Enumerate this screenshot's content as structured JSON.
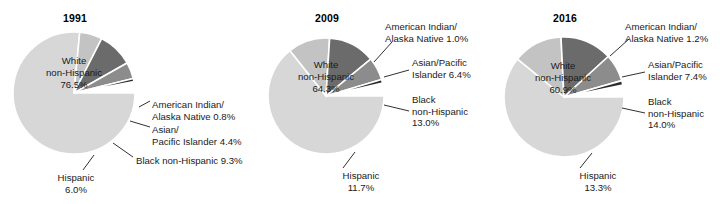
{
  "figure": {
    "background": "#ffffff",
    "panel_count": 3
  },
  "chart_data": [
    {
      "type": "pie",
      "title": "1991",
      "categories": [
        "White non-Hispanic",
        "American Indian/Alaska Native",
        "Asian/Pacific Islander",
        "Black non-Hispanic",
        "Hispanic"
      ],
      "values": [
        76.5,
        0.8,
        4.4,
        9.3,
        6.0
      ],
      "value_labels": [
        "76.5%",
        "0.8%",
        "4.4%",
        "9.3%",
        "6.0%"
      ],
      "colors": [
        "#d7d7d7",
        "#2b2b2b",
        "#8c8c8c",
        "#6b6b6b",
        "#c3c3c3"
      ],
      "legend": "none",
      "annotations": [
        {
          "name": "white-non-hispanic",
          "text_lines": [
            "White",
            "non-Hispanic",
            "76.5%"
          ],
          "placement": "inside"
        },
        {
          "name": "american-indian-alaska-native",
          "text_lines": [
            "American Indian/",
            "Alaska Native 0.8%"
          ],
          "placement": "right"
        },
        {
          "name": "asian-pacific-islander",
          "text_lines": [
            "Asian/",
            "Pacific Islander 4.4%"
          ],
          "placement": "right"
        },
        {
          "name": "black-non-hispanic",
          "text_lines": [
            "Black non-Hispanic 9.3%"
          ],
          "placement": "right"
        },
        {
          "name": "hispanic",
          "text_lines": [
            "Hispanic",
            "6.0%"
          ],
          "placement": "bottom"
        }
      ]
    },
    {
      "type": "pie",
      "title": "2009",
      "categories": [
        "White non-Hispanic",
        "American Indian/Alaska Native",
        "Asian/Pacific Islander",
        "Black non-Hispanic",
        "Hispanic"
      ],
      "values": [
        64.3,
        1.0,
        6.4,
        13.0,
        11.7
      ],
      "value_labels": [
        "64.3%",
        "1.0%",
        "6.4%",
        "13.0%",
        "11.7%"
      ],
      "colors": [
        "#d7d7d7",
        "#2b2b2b",
        "#8c8c8c",
        "#6b6b6b",
        "#c3c3c3"
      ],
      "legend": "none",
      "annotations": [
        {
          "name": "white-non-hispanic",
          "text_lines": [
            "White",
            "non-Hispanic",
            "64.3%"
          ],
          "placement": "inside"
        },
        {
          "name": "american-indian-alaska-native",
          "text_lines": [
            "American Indian/",
            "Alaska Native 1.0%"
          ],
          "placement": "right"
        },
        {
          "name": "asian-pacific-islander",
          "text_lines": [
            "Asian/Pacific",
            "Islander 6.4%"
          ],
          "placement": "right"
        },
        {
          "name": "black-non-hispanic",
          "text_lines": [
            "Black",
            "non-Hispanic",
            "13.0%"
          ],
          "placement": "right"
        },
        {
          "name": "hispanic",
          "text_lines": [
            "Hispanic",
            "11.7%"
          ],
          "placement": "bottom"
        }
      ]
    },
    {
      "type": "pie",
      "title": "2016",
      "categories": [
        "White non-Hispanic",
        "American Indian/Alaska Native",
        "Asian/Pacific Islander",
        "Black non-Hispanic",
        "Hispanic"
      ],
      "values": [
        60.9,
        1.2,
        7.4,
        14.0,
        13.3
      ],
      "value_labels": [
        "60.9%",
        "1.2%",
        "7.4%",
        "14.0%",
        "13.3%"
      ],
      "colors": [
        "#d7d7d7",
        "#2b2b2b",
        "#8c8c8c",
        "#6b6b6b",
        "#c3c3c3"
      ],
      "legend": "none",
      "annotations": [
        {
          "name": "white-non-hispanic",
          "text_lines": [
            "White",
            "non-Hispanic",
            "60.9%"
          ],
          "placement": "inside"
        },
        {
          "name": "american-indian-alaska-native",
          "text_lines": [
            "American Indian/",
            "Alaska Native 1.2%"
          ],
          "placement": "right"
        },
        {
          "name": "asian-pacific-islander",
          "text_lines": [
            "Asian/Pacific",
            "Islander 7.4%"
          ],
          "placement": "right"
        },
        {
          "name": "black-non-hispanic",
          "text_lines": [
            "Black",
            "non-Hispanic",
            "14.0%"
          ],
          "placement": "right"
        },
        {
          "name": "hispanic",
          "text_lines": [
            "Hispanic",
            "13.3%"
          ],
          "placement": "bottom"
        }
      ]
    }
  ],
  "panels": [
    {
      "title": "1991",
      "title_pos": {
        "x": 52,
        "y": 12,
        "w": 46
      },
      "center": {
        "x": 74,
        "y": 93
      },
      "radius": 61,
      "inside_label": {
        "x": 24,
        "y": 55,
        "w": 100,
        "lines": [
          "White",
          "non-Hispanic",
          "76.5%"
        ]
      },
      "side_labels": [
        {
          "name": "american-indian-alaska-native",
          "x": 152,
          "y": 99,
          "align": "left",
          "lines": [
            "American Indian/",
            "Alaska Native 0.8%"
          ]
        },
        {
          "name": "asian-pacific-islander",
          "x": 152,
          "y": 124,
          "align": "left",
          "lines": [
            "Asian/",
            "Pacific Islander 4.4%"
          ]
        },
        {
          "name": "black-non-hispanic",
          "x": 136,
          "y": 155,
          "align": "left",
          "lines": [
            "Black non-Hispanic 9.3%"
          ]
        },
        {
          "name": "hispanic",
          "x": 49,
          "y": 172,
          "align": "center",
          "w": 54,
          "lines": [
            "Hispanic",
            "6.0%"
          ]
        }
      ],
      "leaders": [
        [
          139,
          107,
          150,
          101
        ],
        [
          130,
          121,
          150,
          127
        ],
        [
          113,
          143,
          133,
          157
        ],
        [
          94,
          155,
          83,
          170
        ]
      ]
    },
    {
      "title": "2009",
      "title_pos": {
        "x": 304,
        "y": 12,
        "w": 46
      },
      "center": {
        "x": 326,
        "y": 96
      },
      "radius": 58,
      "inside_label": {
        "x": 276,
        "y": 59,
        "w": 100,
        "lines": [
          "White",
          "non-Hispanic",
          "64.3%"
        ]
      },
      "side_labels": [
        {
          "name": "american-indian-alaska-native",
          "x": 385,
          "y": 21,
          "align": "left",
          "lines": [
            "American Indian/",
            "Alaska Native 1.0%"
          ]
        },
        {
          "name": "asian-pacific-islander",
          "x": 412,
          "y": 57,
          "align": "left",
          "lines": [
            "Asian/Pacific",
            "Islander 6.4%"
          ]
        },
        {
          "name": "black-non-hispanic",
          "x": 412,
          "y": 94,
          "align": "left",
          "lines": [
            "Black",
            "non-Hispanic",
            "13.0%"
          ]
        },
        {
          "name": "hispanic",
          "x": 333,
          "y": 170,
          "align": "center",
          "w": 56,
          "lines": [
            "Hispanic",
            "11.7%"
          ]
        }
      ],
      "leaders": [
        [
          374,
          62,
          392,
          42
        ],
        [
          384,
          77,
          409,
          70
        ],
        [
          384,
          105,
          409,
          111
        ],
        [
          355,
          152,
          343,
          168
        ]
      ]
    },
    {
      "title": "2016",
      "title_pos": {
        "x": 542,
        "y": 12,
        "w": 46
      },
      "center": {
        "x": 564,
        "y": 97
      },
      "radius": 60,
      "inside_label": {
        "x": 513,
        "y": 60,
        "w": 100,
        "lines": [
          "White",
          "non-Hispanic",
          "60.9%"
        ]
      },
      "side_labels": [
        {
          "name": "american-indian-alaska-native",
          "x": 625,
          "y": 21,
          "align": "left",
          "lines": [
            "American Indian/",
            "Alaska Native 1.2%"
          ]
        },
        {
          "name": "asian-pacific-islander",
          "x": 648,
          "y": 59,
          "align": "left",
          "lines": [
            "Asian/Pacific",
            "Islander 7.4%"
          ]
        },
        {
          "name": "black-non-hispanic",
          "x": 648,
          "y": 96,
          "align": "left",
          "lines": [
            "Black",
            "non-Hispanic",
            "14.0%"
          ]
        },
        {
          "name": "hispanic",
          "x": 570,
          "y": 170,
          "align": "center",
          "w": 56,
          "lines": [
            "Hispanic",
            "13.3%"
          ]
        }
      ],
      "leaders": [
        [
          610,
          56,
          629,
          39
        ],
        [
          622,
          77,
          645,
          72
        ],
        [
          622,
          108,
          645,
          113
        ],
        [
          592,
          153,
          580,
          168
        ]
      ]
    }
  ]
}
